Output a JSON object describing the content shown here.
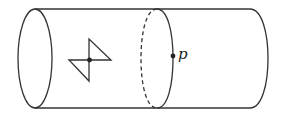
{
  "diagram": {
    "colors": {
      "stroke": "#333333",
      "background": "#ffffff"
    },
    "labels": {
      "point_p": "p"
    },
    "elements": [
      {
        "type": "cylinder",
        "orientation": "horizontal"
      },
      {
        "type": "bowtie-figure",
        "note": "two triangles meeting at a marked central point"
      },
      {
        "type": "cross-section-circle",
        "style": "back half dashed, front half solid"
      },
      {
        "type": "point",
        "label": "p",
        "location": "on front of cross-section circle"
      }
    ]
  }
}
